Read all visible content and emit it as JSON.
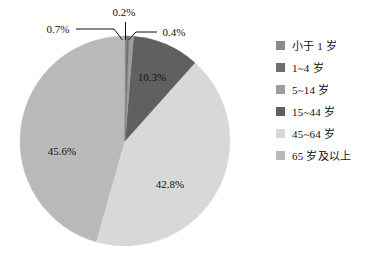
{
  "chart_data": {
    "type": "pie",
    "title": "",
    "subtitle": "",
    "xlabel": "",
    "ylabel": "",
    "legend_position": "right",
    "grid": false,
    "start_angle_deg": 0,
    "direction": "clockwise",
    "categories": [
      "小于 1 岁",
      "1~4 岁",
      "5~14 岁",
      "15~44 岁",
      "45~64 岁",
      "65 岁及以上"
    ],
    "values": [
      0.2,
      0.4,
      0.7,
      10.3,
      42.8,
      45.6
    ],
    "value_labels": [
      "0.2%",
      "0.4%",
      "0.7%",
      "10.3%",
      "42.8%",
      "45.6%"
    ],
    "colors": [
      "#8a8a8a",
      "#6e6e6e",
      "#9d9d9d",
      "#606060",
      "#d8d8d8",
      "#b9b9b9"
    ],
    "slices": [
      {
        "name": "小于 1 岁",
        "value": 0.2,
        "label": "0.2%",
        "color": "#8a8a8a",
        "label_style": "callout",
        "callout": "top"
      },
      {
        "name": "1~4 岁",
        "value": 0.4,
        "label": "0.4%",
        "color": "#6e6e6e",
        "label_style": "callout",
        "callout": "right"
      },
      {
        "name": "5~14 岁",
        "value": 0.7,
        "label": "0.7%",
        "color": "#9d9d9d",
        "label_style": "callout",
        "callout": "left"
      },
      {
        "name": "15~44 岁",
        "value": 10.3,
        "label": "10.3%",
        "color": "#606060",
        "label_style": "inside"
      },
      {
        "name": "45~64 岁",
        "value": 42.8,
        "label": "42.8%",
        "color": "#d8d8d8",
        "label_style": "inside"
      },
      {
        "name": "65 岁及以上",
        "value": 45.6,
        "label": "45.6%",
        "color": "#b9b9b9",
        "label_style": "inside"
      }
    ]
  },
  "chart": {
    "inside_labels": [
      {
        "text": "10.3%",
        "x": 152,
        "y": 81
      },
      {
        "text": "42.8%",
        "x": 170,
        "y": 188
      },
      {
        "text": "45.6%",
        "x": 62,
        "y": 155
      }
    ],
    "callouts": [
      {
        "text": "0.2%",
        "x": 124,
        "y": 16,
        "anchor": "middle"
      },
      {
        "text": "0.7%",
        "x": 58,
        "y": 33,
        "anchor": "middle"
      },
      {
        "text": "0.4%",
        "x": 174,
        "y": 36,
        "anchor": "middle"
      }
    ]
  },
  "legend": {
    "items": [
      {
        "label": "小于 1 岁",
        "color": "#8a8a8a"
      },
      {
        "label": "1~4 岁",
        "color": "#6e6e6e"
      },
      {
        "label": "5~14 岁",
        "color": "#9d9d9d"
      },
      {
        "label": "15~44 岁",
        "color": "#606060"
      },
      {
        "label": "45~64 岁",
        "color": "#d8d8d8"
      },
      {
        "label": "65 岁及以上",
        "color": "#b9b9b9"
      }
    ]
  }
}
